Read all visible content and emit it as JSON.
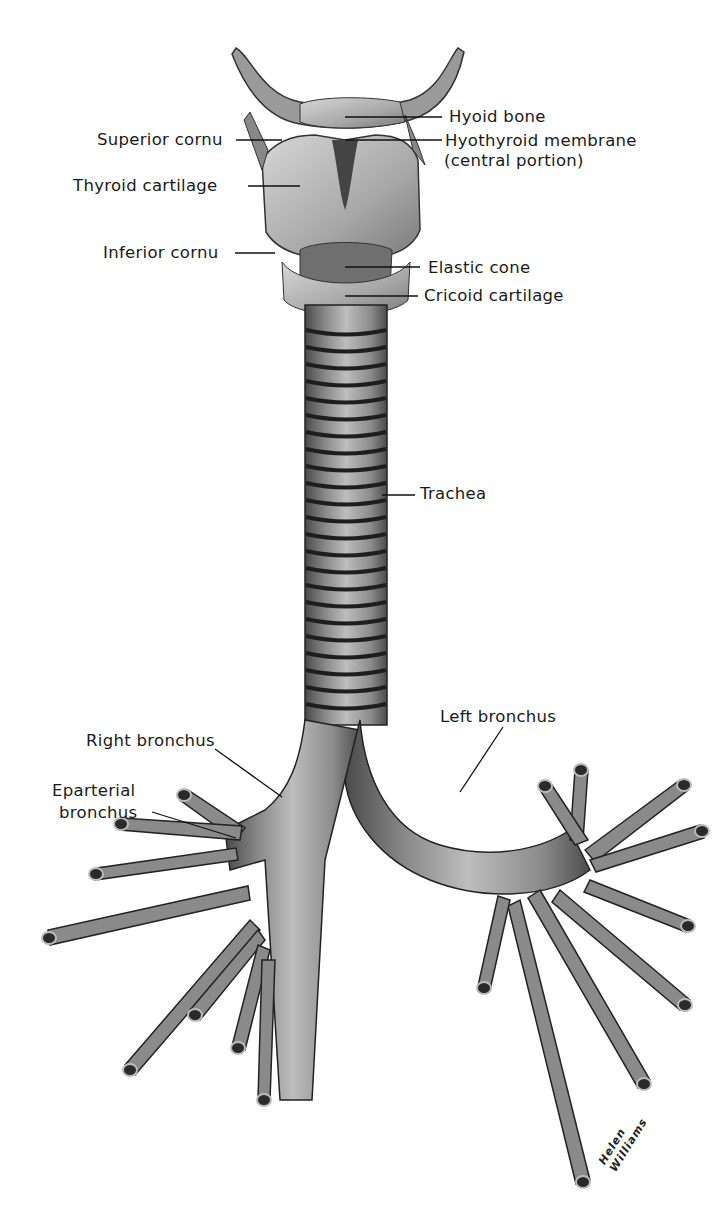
{
  "figure": {
    "labels": {
      "hyoid_bone": "Hyoid bone",
      "superior_cornu": "Superior cornu",
      "hyothyroid_membrane_line1": "Hyothyroid membrane",
      "hyothyroid_membrane_line2": "(central portion)",
      "thyroid_cartilage": "Thyroid cartilage",
      "inferior_cornu": "Inferior cornu",
      "elastic_cone": "Elastic cone",
      "cricoid_cartilage": "Cricoid cartilage",
      "trachea": "Trachea",
      "left_bronchus": "Left bronchus",
      "right_bronchus": "Right bronchus",
      "eparterial_bronchus_line1": "Eparterial",
      "eparterial_bronchus_line2": "bronchus"
    },
    "signature": "Helen Williams"
  }
}
